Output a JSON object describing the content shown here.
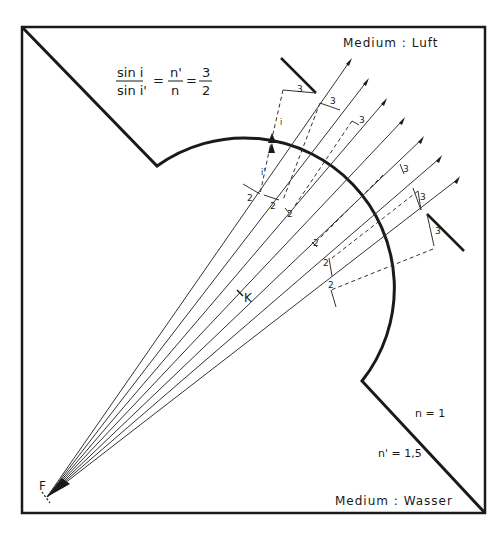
{
  "formula": {
    "lhs_numerator": "sin i",
    "lhs_denominator": "sin i'",
    "equals1": "=",
    "mid_numerator": "n'",
    "mid_denominator": "n",
    "equals2": "=",
    "rhs_numerator": "3",
    "rhs_denominator": "2"
  },
  "media": {
    "top_label": "Medium : Luft",
    "bottom_label": "Medium : Wasser",
    "n_air": "n = 1",
    "n_water": "n' = 1,5"
  },
  "points": {
    "focus": "F",
    "center": "K"
  },
  "ray_labels": {
    "incident_angle": "i",
    "refracted_angle": "i'",
    "segment_water": "2",
    "segment_air": "3"
  },
  "colors": {
    "stroke": "#1a1a1a",
    "background": "#ffffff"
  }
}
